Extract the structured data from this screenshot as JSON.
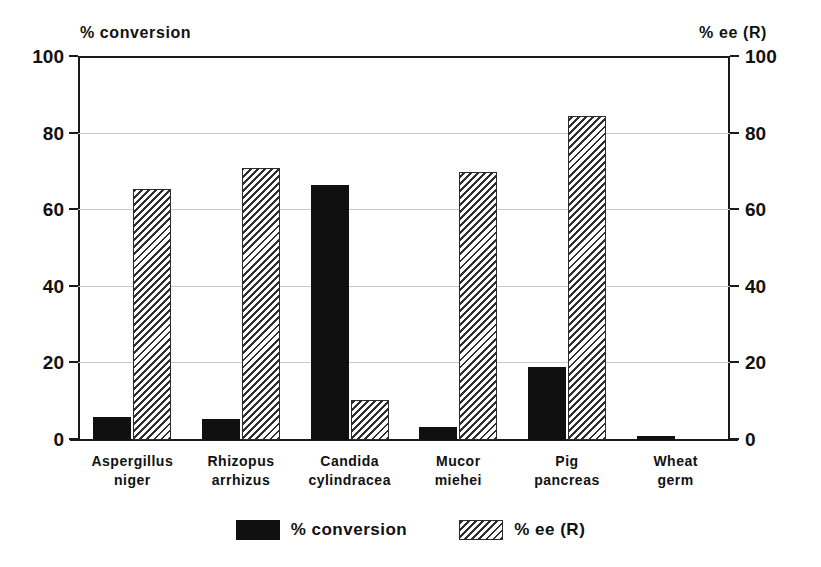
{
  "chart_data": {
    "type": "bar",
    "title": "",
    "subtitle": "",
    "xlabel": "",
    "ylabel": "% conversion",
    "y2label": "% ee (R)",
    "ylim": [
      0,
      100
    ],
    "y2lim": [
      0,
      100
    ],
    "yticks": [
      0,
      20,
      40,
      60,
      80,
      100
    ],
    "ytick_labels": [
      "0",
      "20",
      "40",
      "60",
      "80",
      "100"
    ],
    "y2ticks": [
      0,
      20,
      40,
      60,
      80,
      100
    ],
    "y2tick_labels": [
      "0",
      "20",
      "40",
      "60",
      "80",
      "100"
    ],
    "grid": true,
    "grid_axis": "y",
    "legend_position": "bottom-center",
    "categories": [
      "Aspergillus\nniger",
      "Rhizopus\narrhizus",
      "Candida\ncylindracea",
      "Mucor\nmiehei",
      "Pig\npancreas",
      "Wheat\ngerm"
    ],
    "category_lines": [
      [
        "Aspergillus",
        "niger"
      ],
      [
        "Rhizopus",
        "arrhizus"
      ],
      [
        "Candida",
        "cylindracea"
      ],
      [
        "Mucor",
        "miehei"
      ],
      [
        "Pig",
        "pancreas"
      ],
      [
        "Wheat",
        "germ"
      ]
    ],
    "series": [
      {
        "name": "% conversion",
        "axis": "left",
        "fill": "solid-black",
        "color": "#101010",
        "values": [
          6,
          5.5,
          66.5,
          3.5,
          19,
          1
        ]
      },
      {
        "name": "% ee (R)",
        "axis": "right",
        "fill": "diagonal-hatch",
        "color": "#2f2f2f",
        "values": [
          65.5,
          71,
          10.5,
          70,
          84.5,
          0
        ]
      }
    ]
  },
  "captions": {
    "left_axis": "% conversion",
    "right_axis": "% ee (R)"
  },
  "legend": {
    "items": [
      {
        "label": "% conversion",
        "style": "solid"
      },
      {
        "label": "% ee (R)",
        "style": "hatch"
      }
    ]
  },
  "colors": {
    "series_conversion": "#101010",
    "series_ee": "#2f2f2f",
    "axis": "#1a1a1a",
    "grid": "#c9c9c9",
    "background": "#ffffff"
  }
}
